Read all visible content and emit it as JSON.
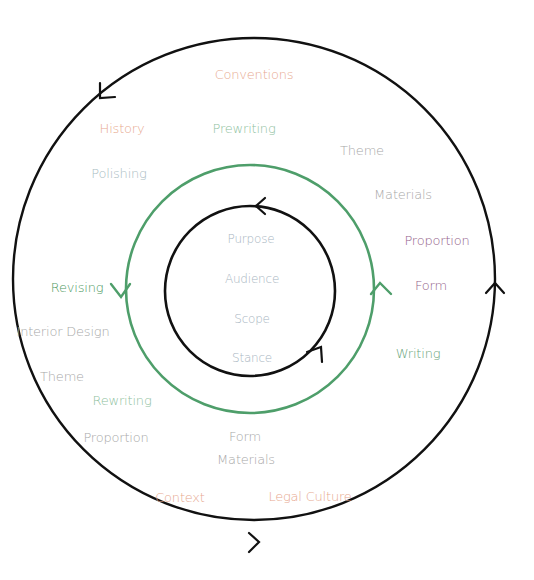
{
  "colors": {
    "outer_circle": "#111111",
    "green_circle": "#4e9e6a",
    "inner_circle": "#111111",
    "orange_text": "#e7a98f",
    "green_text": "#7fb48e",
    "gray_text": "#a8a8a8",
    "blue_gray_text": "#a9b6c2",
    "purple_text": "#93628a",
    "dark_green_text": "#4f9a63"
  },
  "circles": {
    "outer": {
      "cx": 254,
      "cy": 279,
      "r": 241,
      "stroke": "#111111"
    },
    "middle": {
      "cx": 250,
      "cy": 289,
      "r": 124,
      "stroke": "#4e9e6a"
    },
    "inner": {
      "cx": 250,
      "cy": 291,
      "r": 85,
      "stroke": "#111111"
    }
  },
  "arrows": [
    {
      "name": "outer-top-left-arrow",
      "direction": "counterclockwise",
      "x": 102,
      "y": 96
    },
    {
      "name": "outer-right-arrow",
      "direction": "up",
      "x": 495,
      "y": 290
    },
    {
      "name": "outer-bottom-arrow",
      "direction": "right",
      "x": 258,
      "y": 542
    },
    {
      "name": "middle-left-arrow",
      "direction": "down",
      "x": 121,
      "y": 297
    },
    {
      "name": "middle-right-arrow",
      "direction": "up",
      "x": 380,
      "y": 285
    },
    {
      "name": "inner-top-arrow",
      "direction": "left",
      "x": 257,
      "y": 207
    },
    {
      "name": "inner-bottom-right-arrow",
      "direction": "up-right",
      "x": 321,
      "y": 350
    }
  ],
  "labels": {
    "conventions": {
      "text": "Conventions",
      "x": 254,
      "y": 74,
      "color": "#e7a98f",
      "size": 13
    },
    "history": {
      "text": "History",
      "x": 122,
      "y": 128,
      "color": "#e7a98f",
      "size": 13
    },
    "prewriting": {
      "text": "Prewriting",
      "x": 244,
      "y": 128,
      "color": "#8fbfa0",
      "size": 13
    },
    "theme_top": {
      "text": "Theme",
      "x": 362,
      "y": 150,
      "color": "#a8a8a8",
      "size": 13
    },
    "polishing": {
      "text": "Polishing",
      "x": 119,
      "y": 173,
      "color": "#a9bcc2",
      "size": 13
    },
    "materials_top": {
      "text": "Materials",
      "x": 403,
      "y": 194,
      "color": "#a8a8a8",
      "size": 13
    },
    "proportion_right": {
      "text": "Proportion",
      "x": 437,
      "y": 240,
      "color": "#93628a",
      "size": 13
    },
    "form_right": {
      "text": "Form",
      "x": 431,
      "y": 285,
      "color": "#93628a",
      "size": 13
    },
    "writing": {
      "text": "Writing",
      "x": 418,
      "y": 353,
      "color": "#6aa57c",
      "size": 13
    },
    "revising": {
      "text": "Revising",
      "x": 77,
      "y": 287,
      "color": "#4f9a63",
      "size": 13
    },
    "interior_design": {
      "text": "Interior Design",
      "x": 63,
      "y": 331,
      "color": "#a8a8a8",
      "size": 13
    },
    "theme_left": {
      "text": "Theme",
      "x": 62,
      "y": 376,
      "color": "#a8a8a8",
      "size": 13
    },
    "rewriting": {
      "text": "Rewriting",
      "x": 122,
      "y": 400,
      "color": "#8fbfa0",
      "size": 13
    },
    "proportion_left": {
      "text": "Proportion",
      "x": 116,
      "y": 437,
      "color": "#a8a8a8",
      "size": 13
    },
    "form_bottom": {
      "text": "Form",
      "x": 245,
      "y": 436,
      "color": "#a8a8a8",
      "size": 13
    },
    "materials_bottom": {
      "text": "Materials",
      "x": 246,
      "y": 459,
      "color": "#a8a8a8",
      "size": 13
    },
    "context": {
      "text": "Context",
      "x": 180,
      "y": 497,
      "color": "#e7a98f",
      "size": 13
    },
    "legal_culture": {
      "text": "Legal Culture",
      "x": 310,
      "y": 496,
      "color": "#e7a98f",
      "size": 13
    },
    "purpose": {
      "text": "Purpose",
      "x": 251,
      "y": 239,
      "color": "#a9b6c2",
      "size": 12
    },
    "audience": {
      "text": "Audience",
      "x": 252,
      "y": 279,
      "color": "#a9b6c2",
      "size": 12
    },
    "scope": {
      "text": "Scope",
      "x": 252,
      "y": 319,
      "color": "#a9b6c2",
      "size": 12
    },
    "stance": {
      "text": "Stance",
      "x": 252,
      "y": 358,
      "color": "#a9b6c2",
      "size": 12
    }
  }
}
